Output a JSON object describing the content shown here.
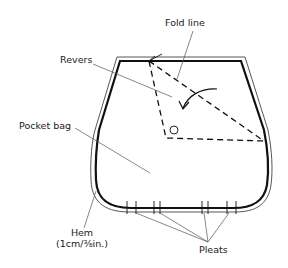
{
  "diagram": {
    "labels": {
      "fold_line": "Fold line",
      "revers": "Revers",
      "pocket_bag": "Pocket bag",
      "hem_line1": "Hem",
      "hem_line2": "(1cm/⅜in.)",
      "pleats": "Pleats"
    },
    "colors": {
      "outline": "#111111",
      "hem_line": "#444444",
      "leader": "#555555",
      "background": "#ffffff"
    },
    "pleat_marks_x": [
      127,
      136,
      154,
      160,
      202,
      208,
      227,
      236
    ]
  }
}
